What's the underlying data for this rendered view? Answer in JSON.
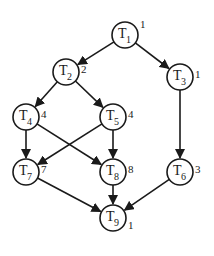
{
  "diagram": {
    "type": "task-graph",
    "nodes": [
      {
        "id": "T1",
        "letter": "T",
        "sub": "1",
        "weight": "1",
        "x": 125,
        "y": 35
      },
      {
        "id": "T2",
        "letter": "T",
        "sub": "2",
        "weight": "2",
        "x": 66,
        "y": 72
      },
      {
        "id": "T3",
        "letter": "T",
        "sub": "3",
        "weight": "1",
        "x": 180,
        "y": 77
      },
      {
        "id": "T4",
        "letter": "T",
        "sub": "4",
        "weight": "4",
        "x": 26,
        "y": 117
      },
      {
        "id": "T5",
        "letter": "T",
        "sub": "5",
        "weight": "4",
        "x": 113,
        "y": 117
      },
      {
        "id": "T6",
        "letter": "T",
        "sub": "6",
        "weight": "3",
        "x": 180,
        "y": 172
      },
      {
        "id": "T7",
        "letter": "T",
        "sub": "7",
        "weight": "7",
        "x": 26,
        "y": 172
      },
      {
        "id": "T8",
        "letter": "T",
        "sub": "8",
        "weight": "8",
        "x": 113,
        "y": 172
      },
      {
        "id": "T9",
        "letter": "T",
        "sub": "9",
        "weight": "1",
        "x": 113,
        "y": 218
      }
    ],
    "edges": [
      {
        "from": "T1",
        "to": "T2"
      },
      {
        "from": "T1",
        "to": "T3"
      },
      {
        "from": "T2",
        "to": "T4"
      },
      {
        "from": "T2",
        "to": "T5"
      },
      {
        "from": "T3",
        "to": "T6"
      },
      {
        "from": "T4",
        "to": "T7"
      },
      {
        "from": "T4",
        "to": "T8"
      },
      {
        "from": "T5",
        "to": "T7"
      },
      {
        "from": "T5",
        "to": "T8"
      },
      {
        "from": "T7",
        "to": "T9"
      },
      {
        "from": "T8",
        "to": "T9"
      },
      {
        "from": "T6",
        "to": "T9"
      }
    ],
    "node_radius": 13,
    "stroke_color": "#1a1a1a"
  }
}
